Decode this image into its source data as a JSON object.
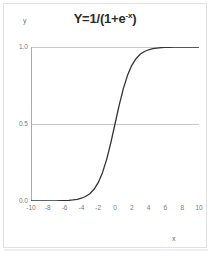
{
  "chart_data": {
    "type": "line",
    "title": "Y=1/(1+e-x)",
    "title_base": "Y=1/(1+e",
    "title_sup": "-x",
    "title_tail": ")",
    "xlabel": "x",
    "ylabel": "y",
    "xlim": [
      -10,
      10
    ],
    "ylim": [
      0.0,
      1.0
    ],
    "grid": true,
    "legend": null,
    "xticks": [
      "-10",
      "-8",
      "-6",
      "-4",
      "-2",
      "0",
      "2",
      "4",
      "6",
      "8",
      "10"
    ],
    "xtick_values": [
      -10,
      -8,
      -6,
      -4,
      -2,
      0,
      2,
      4,
      6,
      8,
      10
    ],
    "xminor_step": 1,
    "yticks": [
      "0.0",
      "0.5",
      "1.0"
    ],
    "ytick_values": [
      0.0,
      0.5,
      1.0
    ],
    "series": [
      {
        "name": "logistic",
        "color": "#333333",
        "x": [
          -10,
          -9.5,
          -9,
          -8.5,
          -8,
          -7.5,
          -7,
          -6.5,
          -6,
          -5.5,
          -5,
          -4.5,
          -4,
          -3.5,
          -3,
          -2.5,
          -2,
          -1.5,
          -1,
          -0.5,
          0,
          0.5,
          1,
          1.5,
          2,
          2.5,
          3,
          3.5,
          4,
          4.5,
          5,
          5.5,
          6,
          6.5,
          7,
          7.5,
          8,
          8.5,
          9,
          9.5,
          10
        ],
        "values": [
          4.54e-05,
          7.49e-05,
          0.0001234,
          0.0002035,
          0.0003354,
          0.0005527,
          0.000911,
          0.0015011,
          0.0024726,
          0.0040701,
          0.0066929,
          0.0109869,
          0.0179862,
          0.0293122,
          0.0474259,
          0.0758582,
          0.1192029,
          0.1824255,
          0.2689414,
          0.3775407,
          0.5,
          0.6224593,
          0.7310586,
          0.8175745,
          0.8807971,
          0.9241418,
          0.9525741,
          0.9706877,
          0.9820138,
          0.9890131,
          0.9933071,
          0.9959299,
          0.9975274,
          0.9984989,
          0.999089,
          0.9994473,
          0.9996646,
          0.9997965,
          0.9998766,
          0.9999251,
          0.9999546
        ]
      }
    ]
  },
  "colors": {
    "curve": "#333333",
    "gridline": "#c9c9c9",
    "axis": "#aaaaaa",
    "tick_text": "#7a7a7a",
    "title_text": "#2b2b2b",
    "background": "#ffffff"
  }
}
